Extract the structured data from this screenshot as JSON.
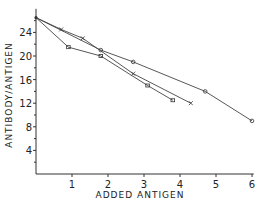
{
  "chart_data": {
    "type": "line",
    "title": "",
    "xlabel": "ADDED ANTIGEN",
    "ylabel": "ANTIBODY/ANTIGEN",
    "xlim": [
      0,
      6
    ],
    "ylim": [
      0,
      28
    ],
    "x_ticks": [
      1,
      2,
      3,
      4,
      5,
      6
    ],
    "y_ticks": [
      4,
      8,
      12,
      16,
      20,
      24
    ],
    "grid": false,
    "legend": null,
    "series": [
      {
        "name": "circles",
        "marker": "circle",
        "x": [
          0,
          1.8,
          2.7,
          4.7,
          6.0
        ],
        "y": [
          26.5,
          21.0,
          19.0,
          14.0,
          9.0
        ]
      },
      {
        "name": "crosses",
        "marker": "x",
        "x": [
          0,
          0.7,
          1.3,
          2.7,
          4.3
        ],
        "y": [
          26.5,
          24.5,
          23.0,
          17.0,
          12.0
        ]
      },
      {
        "name": "squares",
        "marker": "square",
        "x": [
          0,
          0.9,
          1.8,
          3.1,
          3.8
        ],
        "y": [
          26.5,
          21.5,
          20.0,
          15.0,
          12.5
        ]
      }
    ]
  },
  "axes": {
    "x_label": "ADDED ANTIGEN",
    "y_label": "ANTIBODY/ANTIGEN",
    "x_tick_labels": [
      "1",
      "2",
      "3",
      "4",
      "5",
      "6"
    ],
    "y_tick_labels": [
      "4",
      "8",
      "12",
      "16",
      "20",
      "24"
    ]
  }
}
